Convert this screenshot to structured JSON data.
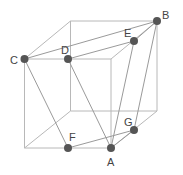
{
  "diagram": {
    "type": "cube-geometry",
    "colors": {
      "edge": "#b8b8b8",
      "segment": "#9a9a9a",
      "point": "#555555",
      "label": "#444444"
    },
    "cube_vertices": {
      "ftl": [
        24.5,
        59
      ],
      "ftr": [
        111,
        59
      ],
      "fbr": [
        111,
        148
      ],
      "fbl": [
        24.5,
        148
      ],
      "btl": [
        70.5,
        21
      ],
      "btr": [
        157,
        21
      ],
      "bbr": [
        157,
        111
      ],
      "bbl": [
        70.5,
        111
      ]
    },
    "points": [
      {
        "label": "A",
        "x": 111,
        "y": 148,
        "lx": 107,
        "ly": 166
      },
      {
        "label": "B",
        "x": 157,
        "y": 21,
        "lx": 162,
        "ly": 19
      },
      {
        "label": "C",
        "x": 24.5,
        "y": 59,
        "lx": 10,
        "ly": 64
      },
      {
        "label": "D",
        "x": 68,
        "y": 59,
        "lx": 61,
        "ly": 54
      },
      {
        "label": "E",
        "x": 134,
        "y": 41,
        "lx": 124,
        "ly": 37
      },
      {
        "label": "F",
        "x": 68,
        "y": 148,
        "lx": 69,
        "ly": 141
      },
      {
        "label": "G",
        "x": 134,
        "y": 130,
        "lx": 124,
        "ly": 126
      }
    ],
    "segments": [
      [
        "C",
        "B"
      ],
      [
        "D",
        "E"
      ],
      [
        "E",
        "B"
      ],
      [
        "C",
        "F"
      ],
      [
        "D",
        "A"
      ],
      [
        "E",
        "A"
      ],
      [
        "B",
        "G"
      ],
      [
        "F",
        "G"
      ],
      [
        "A",
        "G"
      ]
    ]
  }
}
